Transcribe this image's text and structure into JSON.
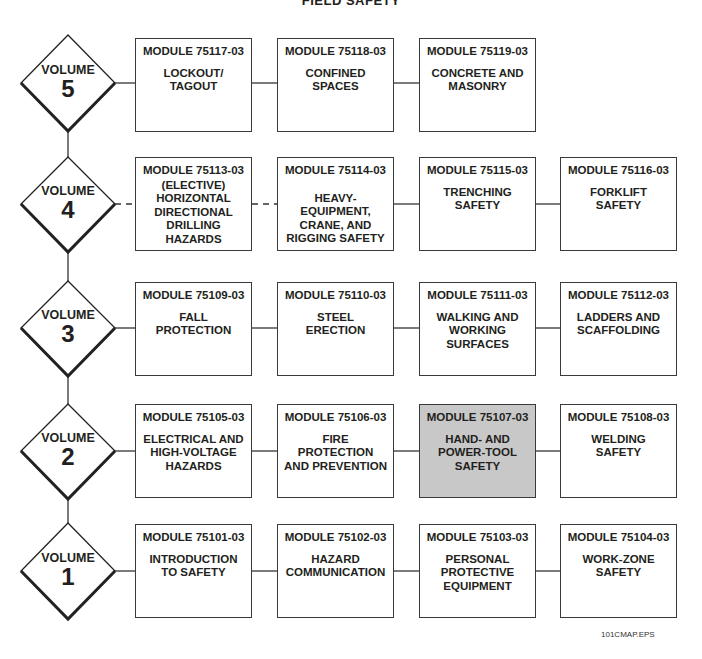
{
  "title": "FIELD SAFETY",
  "footer_code": "101CMAP.EPS",
  "highlight_color": "#c8c8c8",
  "volumes": [
    {
      "label": "VOLUME",
      "number": "5",
      "modules": [
        {
          "code": "MODULE 75117-03",
          "name": "LOCKOUT/\nTAGOUT",
          "highlighted": false
        },
        {
          "code": "MODULE 75118-03",
          "name": "CONFINED\nSPACES",
          "highlighted": false
        },
        {
          "code": "MODULE 75119-03",
          "name": "CONCRETE AND\nMASONRY",
          "highlighted": false
        }
      ]
    },
    {
      "label": "VOLUME",
      "number": "4",
      "modules": [
        {
          "code": "MODULE 75113-03",
          "name": "(ELECTIVE)\nHORIZONTAL\nDIRECTIONAL\nDRILLING\nHAZARDS",
          "highlighted": false,
          "elective": true
        },
        {
          "code": "MODULE 75114-03",
          "name": "HEAVY-\nEQUIPMENT,\nCRANE, AND\nRIGGING SAFETY",
          "highlighted": false
        },
        {
          "code": "MODULE 75115-03",
          "name": "TRENCHING\nSAFETY",
          "highlighted": false
        },
        {
          "code": "MODULE 75116-03",
          "name": "FORKLIFT\nSAFETY",
          "highlighted": false
        }
      ]
    },
    {
      "label": "VOLUME",
      "number": "3",
      "modules": [
        {
          "code": "MODULE 75109-03",
          "name": "FALL\nPROTECTION",
          "highlighted": false
        },
        {
          "code": "MODULE 75110-03",
          "name": "STEEL\nERECTION",
          "highlighted": false
        },
        {
          "code": "MODULE 75111-03",
          "name": "WALKING AND\nWORKING\nSURFACES",
          "highlighted": false
        },
        {
          "code": "MODULE 75112-03",
          "name": "LADDERS AND\nSCAFFOLDING",
          "highlighted": false
        }
      ]
    },
    {
      "label": "VOLUME",
      "number": "2",
      "modules": [
        {
          "code": "MODULE 75105-03",
          "name": "ELECTRICAL AND\nHIGH-VOLTAGE\nHAZARDS",
          "highlighted": false
        },
        {
          "code": "MODULE 75106-03",
          "name": "FIRE\nPROTECTION\nAND PREVENTION",
          "highlighted": false
        },
        {
          "code": "MODULE 75107-03",
          "name": "HAND- AND\nPOWER-TOOL\nSAFETY",
          "highlighted": true
        },
        {
          "code": "MODULE 75108-03",
          "name": "WELDING\nSAFETY",
          "highlighted": false
        }
      ]
    },
    {
      "label": "VOLUME",
      "number": "1",
      "modules": [
        {
          "code": "MODULE 75101-03",
          "name": "INTRODUCTION\nTO SAFETY",
          "highlighted": false
        },
        {
          "code": "MODULE 75102-03",
          "name": "HAZARD\nCOMMUNICATION",
          "highlighted": false
        },
        {
          "code": "MODULE 75103-03",
          "name": "PERSONAL\nPROTECTIVE\nEQUIPMENT",
          "highlighted": false
        },
        {
          "code": "MODULE 75104-03",
          "name": "WORK-ZONE\nSAFETY",
          "highlighted": false
        }
      ]
    }
  ]
}
